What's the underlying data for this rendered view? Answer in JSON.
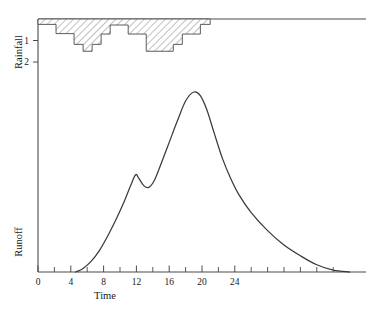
{
  "chart_data": {
    "type": "area",
    "title": "",
    "subtitle": "",
    "xlabel": "Time",
    "xlim": [
      0,
      40
    ],
    "xticks": [
      0,
      4,
      8,
      12,
      16,
      20,
      24
    ],
    "xticklabels": [
      "0",
      "4",
      "8",
      "12",
      "16",
      "20",
      "24"
    ],
    "xminorticks": [
      2,
      6,
      10,
      14,
      18,
      22,
      26,
      28,
      30,
      32,
      34,
      36
    ],
    "grid": false,
    "legend": "none",
    "panels": [
      {
        "name": "rainfall-hyetograph",
        "ylabel": "Rainfall",
        "ylim": [
          0,
          2.6
        ],
        "y_inverted": true,
        "yticks": [
          1,
          2
        ],
        "yticklabels": [
          "1",
          "2"
        ],
        "series_type": "bar",
        "bar_fill": "diagonal-hatch",
        "note": "Rainfall bars hang downward from the top baseline",
        "bars": [
          {
            "t_start": 0.0,
            "t_end": 1.1,
            "depth": 0.25
          },
          {
            "t_start": 1.1,
            "t_end": 2.2,
            "depth": 0.25
          },
          {
            "t_start": 2.2,
            "t_end": 3.3,
            "depth": 0.68
          },
          {
            "t_start": 3.3,
            "t_end": 4.4,
            "depth": 0.68
          },
          {
            "t_start": 4.4,
            "t_end": 5.5,
            "depth": 1.18
          },
          {
            "t_start": 5.5,
            "t_end": 6.6,
            "depth": 1.5
          },
          {
            "t_start": 6.6,
            "t_end": 7.7,
            "depth": 1.18
          },
          {
            "t_start": 7.7,
            "t_end": 8.8,
            "depth": 0.7
          },
          {
            "t_start": 8.8,
            "t_end": 9.9,
            "depth": 0.28
          },
          {
            "t_start": 9.9,
            "t_end": 11.0,
            "depth": 0.28
          },
          {
            "t_start": 11.0,
            "t_end": 12.1,
            "depth": 0.7
          },
          {
            "t_start": 12.1,
            "t_end": 13.2,
            "depth": 0.7
          },
          {
            "t_start": 13.2,
            "t_end": 14.3,
            "depth": 1.5
          },
          {
            "t_start": 14.3,
            "t_end": 15.4,
            "depth": 1.5
          },
          {
            "t_start": 15.4,
            "t_end": 16.5,
            "depth": 1.5
          },
          {
            "t_start": 16.5,
            "t_end": 17.6,
            "depth": 1.18
          },
          {
            "t_start": 17.6,
            "t_end": 18.7,
            "depth": 0.7
          },
          {
            "t_start": 18.7,
            "t_end": 19.8,
            "depth": 0.7
          },
          {
            "t_start": 19.8,
            "t_end": 21.0,
            "depth": 0.25
          }
        ]
      },
      {
        "name": "runoff-hydrograph",
        "ylabel": "Runoff",
        "ylim": [
          0,
          1.15
        ],
        "y_inverted": false,
        "yticks": [],
        "yticklabels": [],
        "series_type": "line",
        "note": "Double-peaked storm hydrograph, baseflow recession to right",
        "points": [
          {
            "t": 4.6,
            "q": 0.0
          },
          {
            "t": 5.5,
            "q": 0.02
          },
          {
            "t": 6.5,
            "q": 0.06
          },
          {
            "t": 7.5,
            "q": 0.12
          },
          {
            "t": 8.5,
            "q": 0.2
          },
          {
            "t": 9.5,
            "q": 0.29
          },
          {
            "t": 10.5,
            "q": 0.39
          },
          {
            "t": 11.3,
            "q": 0.48
          },
          {
            "t": 11.9,
            "q": 0.54
          },
          {
            "t": 12.3,
            "q": 0.52
          },
          {
            "t": 12.9,
            "q": 0.48
          },
          {
            "t": 13.5,
            "q": 0.47
          },
          {
            "t": 14.2,
            "q": 0.51
          },
          {
            "t": 15.0,
            "q": 0.6
          },
          {
            "t": 16.0,
            "q": 0.72
          },
          {
            "t": 17.0,
            "q": 0.84
          },
          {
            "t": 18.0,
            "q": 0.95
          },
          {
            "t": 19.0,
            "q": 1.0
          },
          {
            "t": 19.8,
            "q": 0.98
          },
          {
            "t": 20.6,
            "q": 0.9
          },
          {
            "t": 21.5,
            "q": 0.77
          },
          {
            "t": 22.5,
            "q": 0.63
          },
          {
            "t": 23.5,
            "q": 0.52
          },
          {
            "t": 24.5,
            "q": 0.43
          },
          {
            "t": 26.0,
            "q": 0.33
          },
          {
            "t": 28.0,
            "q": 0.23
          },
          {
            "t": 30.0,
            "q": 0.15
          },
          {
            "t": 32.0,
            "q": 0.09
          },
          {
            "t": 34.0,
            "q": 0.04
          },
          {
            "t": 36.0,
            "q": 0.01
          },
          {
            "t": 38.0,
            "q": 0.0
          }
        ]
      }
    ]
  }
}
